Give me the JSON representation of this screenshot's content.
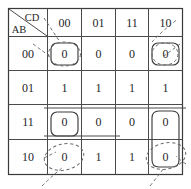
{
  "diagram": {
    "type": "karnaugh-map",
    "corner": {
      "column_variables": "CD",
      "row_variables": "AB"
    },
    "column_headers": [
      "00",
      "01",
      "11",
      "10"
    ],
    "row_headers": [
      "00",
      "01",
      "11",
      "10"
    ],
    "cells": [
      [
        "0",
        "0",
        "0",
        "0"
      ],
      [
        "1",
        "1",
        "1",
        "1"
      ],
      [
        "0",
        "0",
        "0",
        "0"
      ],
      [
        "0",
        "1",
        "1",
        "0"
      ]
    ],
    "groups": [
      {
        "name": "group-row00-col00",
        "style": "solid",
        "row": 0,
        "col": 0
      },
      {
        "name": "group-row00-col10",
        "style": "solid",
        "row": 0,
        "col": 3
      },
      {
        "name": "group-row11-col00",
        "style": "solid",
        "row": 2,
        "col": 0
      },
      {
        "name": "group-right-col-rows-11-10",
        "style": "solid",
        "row": 2,
        "col": 3,
        "span_rows": 2
      },
      {
        "name": "circle-row00-col00",
        "style": "dashed",
        "row": 0,
        "col": 0
      },
      {
        "name": "circle-row00-col10",
        "style": "dashed",
        "row": 0,
        "col": 3
      },
      {
        "name": "circle-row10-col00",
        "style": "dashed",
        "row": 3,
        "col": 0
      },
      {
        "name": "circle-row10-col10",
        "style": "dashed",
        "row": 3,
        "col": 3
      }
    ],
    "colors": {
      "grid": "#4a4a4a",
      "solid_group": "#3d3d3d",
      "dashed_group": "#6b6b6b",
      "text": "#1f1f1f",
      "background": "#ffffff"
    }
  }
}
